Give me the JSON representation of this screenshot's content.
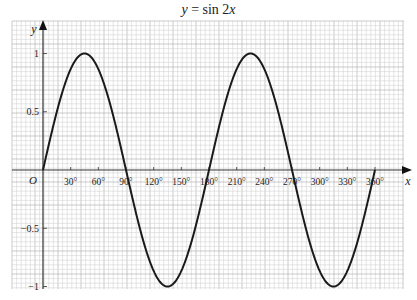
{
  "chart_data": {
    "type": "line",
    "title": "y = sin 2x",
    "title_parts": {
      "y": "y",
      "eq": " = sin 2",
      "x": "x"
    },
    "xlabel": "x",
    "ylabel": "y",
    "origin_label": "O",
    "x_range": [
      0,
      360
    ],
    "ylim": [
      -1,
      1
    ],
    "grid": true,
    "x_ticks": [
      30,
      60,
      90,
      120,
      150,
      180,
      210,
      240,
      270,
      300,
      330,
      360
    ],
    "x_tick_labels": [
      "30°",
      "60°",
      "90°",
      "120°",
      "150°",
      "180°",
      "210°",
      "240°",
      "270°",
      "300°",
      "330°",
      "360°"
    ],
    "y_ticks": [
      1,
      0.5,
      -0.5,
      -1
    ],
    "y_tick_labels": [
      "1",
      "0.5",
      "−0.5",
      "−1"
    ],
    "series": [
      {
        "name": "y = sin 2x",
        "x": [
          0,
          15,
          30,
          45,
          60,
          75,
          90,
          105,
          120,
          135,
          150,
          165,
          180,
          195,
          210,
          225,
          240,
          255,
          270,
          285,
          300,
          315,
          330,
          345,
          360
        ],
        "values": [
          0,
          0.5,
          0.866,
          1,
          0.866,
          0.5,
          0,
          -0.5,
          -0.866,
          -1,
          -0.866,
          -0.5,
          0,
          0.5,
          0.866,
          1,
          0.866,
          0.5,
          0,
          -0.5,
          -0.866,
          -1,
          -0.866,
          -0.5,
          0
        ]
      }
    ],
    "colors": {
      "curve": "#1a1a1a",
      "axis": "#333333",
      "grid_minor": "#d4d4d4",
      "grid_major": "#aaaaaa"
    }
  }
}
